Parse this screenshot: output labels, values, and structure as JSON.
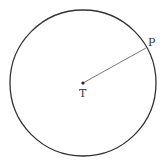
{
  "figure": {
    "circle": {
      "cx": 83,
      "cy": 83,
      "r": 73,
      "stroke": "#333333"
    },
    "center": {
      "x": 83,
      "y": 83,
      "label": "T"
    },
    "point": {
      "x": 146,
      "y": 48,
      "label": "P"
    },
    "radius_segment": {
      "from": "T",
      "to": "P",
      "stroke": "#555555"
    }
  }
}
